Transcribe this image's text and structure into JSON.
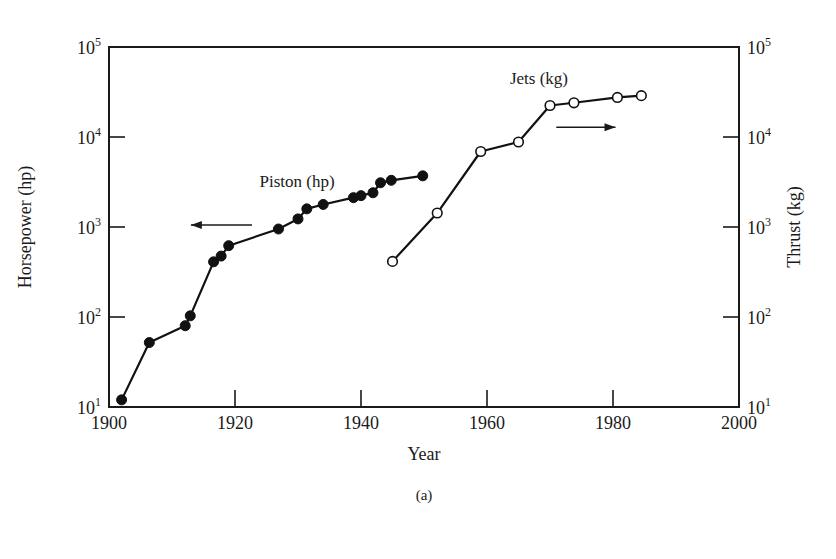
{
  "chart_data": {
    "type": "line",
    "title": "",
    "caption": "(a)",
    "xlabel": "Year",
    "ylabel_left": "Horsepower (hp)",
    "ylabel_right": "Thrust (kg)",
    "y_scale": "log",
    "xlim": [
      1900,
      2000
    ],
    "ylim": [
      10,
      100000
    ],
    "x_ticks": [
      1900,
      1920,
      1940,
      1960,
      1980,
      2000
    ],
    "x_tick_labels": [
      "1900",
      "1920",
      "1940",
      "1960",
      "1980",
      "2000"
    ],
    "y_ticks": [
      10,
      100,
      1000,
      10000,
      100000
    ],
    "y_tick_labels": [
      {
        "base": "10",
        "exp": "1"
      },
      {
        "base": "10",
        "exp": "2"
      },
      {
        "base": "10",
        "exp": "3"
      },
      {
        "base": "10",
        "exp": "4"
      },
      {
        "base": "10",
        "exp": "5"
      }
    ],
    "grid": false,
    "legend": "inline labels",
    "series": [
      {
        "name": "Piston (hp)",
        "axis": "left",
        "marker": "filled-circle",
        "color": "#111111",
        "x": [
          1902,
          1906.4,
          1912.1,
          1912.9,
          1916.6,
          1917.8,
          1919,
          1926.9,
          1930,
          1931.4,
          1934,
          1938.8,
          1940,
          1941.9,
          1943.1,
          1944.8,
          1949.8
        ],
        "values": [
          12,
          52,
          80,
          103,
          410,
          475,
          620,
          950,
          1230,
          1590,
          1780,
          2120,
          2230,
          2400,
          3100,
          3300,
          3700
        ]
      },
      {
        "name": "Jets (kg)",
        "axis": "right",
        "marker": "open-circle",
        "color": "#111111",
        "x": [
          1945,
          1952.1,
          1959,
          1965,
          1970,
          1973.8,
          1980.7,
          1984.5
        ],
        "values": [
          415,
          1430,
          6900,
          8800,
          22400,
          24000,
          27500,
          28800
        ]
      }
    ],
    "annotations": [
      {
        "text": "Piston (hp)",
        "x": 1933.5,
        "y": 2900
      },
      {
        "text": "Jets (kg)",
        "x": 1968.5,
        "y": 53000
      },
      {
        "type": "arrow",
        "direction": "left",
        "from": [
          1922.7,
          1050
        ],
        "to": [
          1913,
          1050
        ]
      },
      {
        "type": "arrow",
        "direction": "right",
        "from": [
          1971,
          12800
        ],
        "to": [
          1980.4,
          12800
        ]
      }
    ]
  },
  "labels": {
    "xlabel": "Year",
    "ylabel_left": "Horsepower (hp)",
    "ylabel_right": "Thrust (kg)",
    "caption": "(a)",
    "piston": "Piston (hp)",
    "jets": "Jets (kg)"
  }
}
